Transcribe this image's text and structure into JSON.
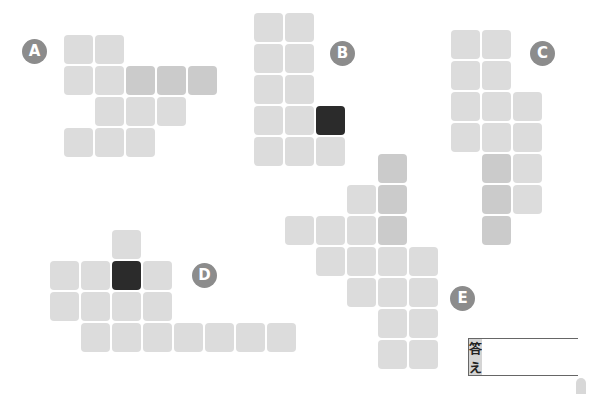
{
  "cell_size": 31,
  "colors": {
    "light": "#dcdcdc",
    "dark": "#cbcbcb",
    "black": "#2b2b2b",
    "badge": "#8c8c8c"
  },
  "figures": [
    {
      "label": "A",
      "origin": [
        64,
        35
      ],
      "badge": [
        22,
        39
      ],
      "cells": [
        [
          0,
          0,
          "l"
        ],
        [
          0,
          1,
          "l"
        ],
        [
          1,
          0,
          "l"
        ],
        [
          1,
          1,
          "l"
        ],
        [
          1,
          2,
          "d"
        ],
        [
          1,
          3,
          "d"
        ],
        [
          1,
          4,
          "d"
        ],
        [
          2,
          1,
          "l"
        ],
        [
          2,
          2,
          "l"
        ],
        [
          2,
          3,
          "l"
        ],
        [
          3,
          0,
          "l"
        ],
        [
          3,
          1,
          "l"
        ],
        [
          3,
          2,
          "l"
        ]
      ]
    },
    {
      "label": "B",
      "origin": [
        254,
        13
      ],
      "badge": [
        330,
        41
      ],
      "cells": [
        [
          0,
          0,
          "l"
        ],
        [
          0,
          1,
          "l"
        ],
        [
          1,
          0,
          "l"
        ],
        [
          1,
          1,
          "l"
        ],
        [
          2,
          0,
          "l"
        ],
        [
          2,
          1,
          "l"
        ],
        [
          3,
          0,
          "l"
        ],
        [
          3,
          1,
          "l"
        ],
        [
          3,
          2,
          "b"
        ],
        [
          4,
          0,
          "l"
        ],
        [
          4,
          1,
          "l"
        ],
        [
          4,
          2,
          "l"
        ]
      ]
    },
    {
      "label": "C",
      "origin": [
        451,
        30
      ],
      "badge": [
        530,
        41
      ],
      "cells": [
        [
          0,
          0,
          "l"
        ],
        [
          0,
          1,
          "l"
        ],
        [
          1,
          0,
          "l"
        ],
        [
          1,
          1,
          "l"
        ],
        [
          2,
          0,
          "l"
        ],
        [
          2,
          1,
          "l"
        ],
        [
          2,
          2,
          "l"
        ],
        [
          3,
          0,
          "l"
        ],
        [
          3,
          1,
          "l"
        ],
        [
          3,
          2,
          "l"
        ],
        [
          4,
          1,
          "d"
        ],
        [
          4,
          2,
          "l"
        ],
        [
          5,
          1,
          "d"
        ],
        [
          5,
          2,
          "l"
        ],
        [
          6,
          1,
          "d"
        ]
      ]
    },
    {
      "label": "D",
      "origin": [
        50,
        230
      ],
      "badge": [
        192,
        263
      ],
      "cells": [
        [
          0,
          2,
          "l"
        ],
        [
          1,
          0,
          "l"
        ],
        [
          1,
          1,
          "l"
        ],
        [
          1,
          2,
          "b"
        ],
        [
          1,
          3,
          "l"
        ],
        [
          2,
          0,
          "l"
        ],
        [
          2,
          1,
          "l"
        ],
        [
          2,
          2,
          "l"
        ],
        [
          2,
          3,
          "l"
        ],
        [
          3,
          1,
          "l"
        ],
        [
          3,
          2,
          "l"
        ],
        [
          3,
          3,
          "l"
        ],
        [
          3,
          4,
          "l"
        ],
        [
          3,
          5,
          "l"
        ],
        [
          3,
          6,
          "l"
        ],
        [
          3,
          7,
          "l"
        ]
      ]
    },
    {
      "label": "E",
      "origin": [
        285,
        154
      ],
      "badge": [
        450,
        286
      ],
      "cells": [
        [
          0,
          3,
          "d"
        ],
        [
          1,
          2,
          "l"
        ],
        [
          1,
          3,
          "d"
        ],
        [
          2,
          0,
          "l"
        ],
        [
          2,
          1,
          "l"
        ],
        [
          2,
          2,
          "l"
        ],
        [
          2,
          3,
          "d"
        ],
        [
          3,
          1,
          "l"
        ],
        [
          3,
          2,
          "l"
        ],
        [
          3,
          3,
          "l"
        ],
        [
          3,
          4,
          "l"
        ],
        [
          4,
          2,
          "l"
        ],
        [
          4,
          3,
          "l"
        ],
        [
          4,
          4,
          "l"
        ],
        [
          5,
          3,
          "l"
        ],
        [
          5,
          4,
          "l"
        ],
        [
          6,
          3,
          "l"
        ],
        [
          6,
          4,
          "l"
        ]
      ]
    }
  ],
  "answer": {
    "label": "答え",
    "value": ""
  }
}
